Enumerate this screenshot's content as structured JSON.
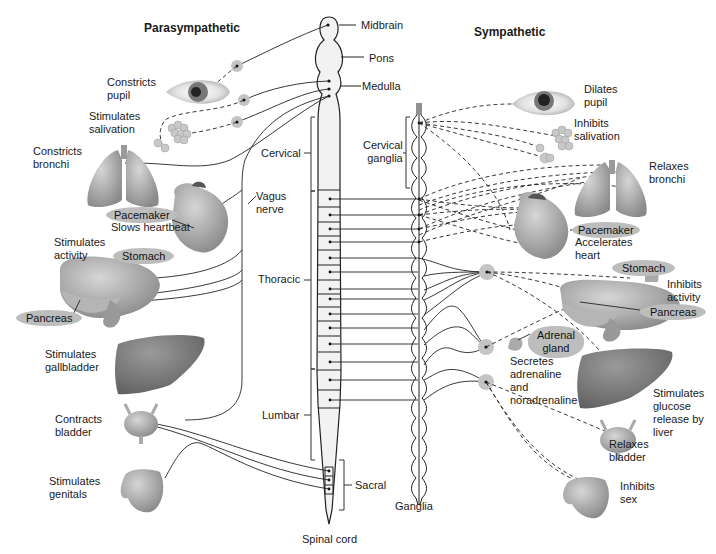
{
  "headers": {
    "parasympathetic": "Parasympathetic",
    "sympathetic": "Sympathetic"
  },
  "brain_regions": [
    "Midbrain",
    "Pons",
    "Medulla"
  ],
  "cord_regions": {
    "cervical": "Cervical",
    "thoracic": "Thoracic",
    "lumbar": "Lumbar",
    "sacral": "Sacral",
    "spinal_cord": "Spinal cord"
  },
  "ganglia": {
    "cervical_ganglia": "Cervical\nganglia",
    "ganglia": "Ganglia"
  },
  "vagus_nerve": "Vagus\nnerve",
  "parasympathetic_effects": [
    {
      "organ": "eye",
      "effect": "Constricts\npupil"
    },
    {
      "organ": "salivary-glands",
      "effect": "Stimulates\nsalivation"
    },
    {
      "organ": "lungs",
      "effect": "Constricts\nbronchi"
    },
    {
      "organ": "heart",
      "effect": "Slows heartbeat",
      "pill": "Pacemaker"
    },
    {
      "organ": "stomach",
      "effect": "Stimulates\nactivity",
      "pill": "Stomach"
    },
    {
      "organ": "pancreas",
      "pill": "Pancreas"
    },
    {
      "organ": "liver",
      "effect": "Stimulates\ngallbladder"
    },
    {
      "organ": "bladder",
      "effect": "Contracts\nbladder"
    },
    {
      "organ": "genitals",
      "effect": "Stimulates\ngenitals"
    }
  ],
  "sympathetic_effects": [
    {
      "organ": "eye",
      "effect": "Dilates\npupil"
    },
    {
      "organ": "salivary-glands",
      "effect": "Inhibits\nsalivation"
    },
    {
      "organ": "lungs",
      "effect": "Relaxes\nbronchi"
    },
    {
      "organ": "heart",
      "effect": "Accelerates\nheart",
      "pill": "Pacemaker"
    },
    {
      "organ": "stomach",
      "effect": "Inhibits\nactivity",
      "pill": "Stomach"
    },
    {
      "organ": "pancreas",
      "pill": "Pancreas"
    },
    {
      "organ": "adrenal",
      "effect": "Secretes\nadrenaline\nand\nnoradrenaline",
      "pill": "Adrenal\ngland"
    },
    {
      "organ": "liver",
      "effect": "Stimulates\nglucose\nrelease by\nliver"
    },
    {
      "organ": "bladder",
      "effect": "Relaxes\nbladder"
    },
    {
      "organ": "genitals",
      "effect": "Inhibits\nsex"
    }
  ],
  "colors": {
    "line": "#222222",
    "pill": "#bdbdbd",
    "organ_fill": "#a8a8a8",
    "cord_fill": "#f2f2f2",
    "ganglion_fill": "#c4c4c4"
  }
}
